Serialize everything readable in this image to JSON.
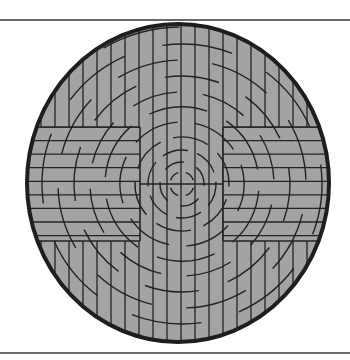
{
  "figure": {
    "type": "circular-grid-pattern",
    "canvas": {
      "width": 350,
      "height": 360
    },
    "rules": {
      "top_y": 20,
      "bottom_y": 353,
      "color": "#6a6a6a"
    },
    "disk": {
      "cx": 178,
      "cy": 183,
      "rx": 151,
      "ry": 159,
      "fill": "#a3a3a3",
      "outline": "#1e1e1e",
      "outline_width": 4
    },
    "line_color": "#232323",
    "arc_center": {
      "cx": 182,
      "cy": 184
    },
    "center_column": {
      "x0": 140,
      "x1": 223
    },
    "side_band": {
      "y0": 127,
      "y1": 241
    },
    "vertical_spacing": 14,
    "horizontal_spacing": 13.6,
    "arc_radii": [
      12,
      22,
      34,
      47,
      62,
      77,
      92,
      108,
      124,
      140,
      157
    ]
  }
}
